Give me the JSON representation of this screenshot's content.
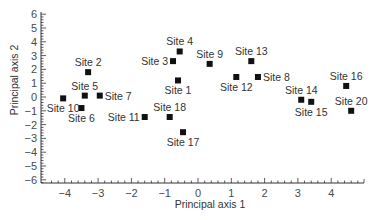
{
  "chart_data": {
    "type": "scatter",
    "title": "",
    "xlabel": "Principal axis 1",
    "ylabel": "Principal axis 2",
    "xlim": [
      -4.4,
      5.0
    ],
    "ylim": [
      -6.3,
      6.3
    ],
    "x_ticks": [
      -4,
      -3,
      -2,
      -1,
      0,
      1,
      2,
      3,
      4
    ],
    "y_ticks": [
      6,
      5,
      4,
      3,
      2,
      1,
      0,
      -1,
      -2,
      -3,
      -4,
      -5,
      -6
    ],
    "x_tick_labels": [
      "−4",
      "−3",
      "−2",
      "−1",
      "0",
      "1",
      "2",
      "3",
      "4"
    ],
    "y_tick_labels": [
      "6",
      "5",
      "4",
      "3",
      "2",
      "1",
      "0",
      "−1",
      "−2",
      "−3",
      "−4",
      "−5",
      "−6"
    ],
    "grid": false,
    "legend": null,
    "marker": "square",
    "marker_color": "#111111",
    "points": [
      {
        "label": "Site 1",
        "x": -0.6,
        "y": 1.2,
        "label_pos": "below"
      },
      {
        "label": "Site 2",
        "x": -3.3,
        "y": 1.8,
        "label_pos": "above"
      },
      {
        "label": "Site 3",
        "x": -0.75,
        "y": 2.6,
        "label_pos": "left"
      },
      {
        "label": "Site 4",
        "x": -0.55,
        "y": 3.3,
        "label_pos": "above"
      },
      {
        "label": "Site 5",
        "x": -3.4,
        "y": 0.1,
        "label_pos": "above"
      },
      {
        "label": "Site 6",
        "x": -3.5,
        "y": -0.8,
        "label_pos": "below"
      },
      {
        "label": "Site 7",
        "x": -2.95,
        "y": 0.1,
        "label_pos": "right"
      },
      {
        "label": "Site 8",
        "x": 1.8,
        "y": 1.45,
        "label_pos": "right"
      },
      {
        "label": "Site 9",
        "x": 0.35,
        "y": 2.4,
        "label_pos": "above"
      },
      {
        "label": "Site 10",
        "x": -4.05,
        "y": -0.1,
        "label_pos": "below"
      },
      {
        "label": "Site 11",
        "x": -1.6,
        "y": -1.45,
        "label_pos": "left"
      },
      {
        "label": "Site 12",
        "x": 1.15,
        "y": 1.45,
        "label_pos": "below"
      },
      {
        "label": "Site 13",
        "x": 1.6,
        "y": 2.6,
        "label_pos": "above"
      },
      {
        "label": "Site 14",
        "x": 3.1,
        "y": -0.2,
        "label_pos": "above"
      },
      {
        "label": "Site 15",
        "x": 3.4,
        "y": -0.35,
        "label_pos": "below"
      },
      {
        "label": "Site 16",
        "x": 4.45,
        "y": 0.8,
        "label_pos": "above"
      },
      {
        "label": "Site 17",
        "x": -0.45,
        "y": -2.55,
        "label_pos": "below"
      },
      {
        "label": "Site 18",
        "x": -0.85,
        "y": -1.45,
        "label_pos": "above"
      },
      {
        "label": "Site 20",
        "x": 4.6,
        "y": -1.0,
        "label_pos": "above"
      }
    ]
  }
}
